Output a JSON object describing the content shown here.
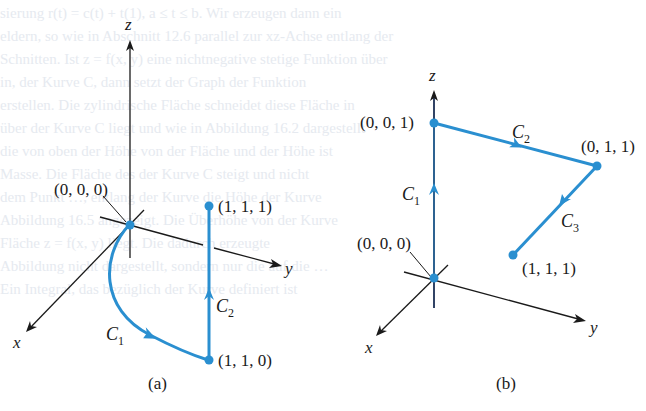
{
  "figure": {
    "colors": {
      "path": "#2a8fd0",
      "axis": "#1a1a1a",
      "axis_dark_z": "#1b2f55",
      "background": "#ffffff",
      "bleed_text": "#e6eaf0"
    },
    "bleed_through_lines": [
      "                              sierung r(t) = c(t) + t(1), a ≤ t ≤ b. Wir erzeugen dann ein",
      "                              eldern, so wie in Abschnitt 12.6 parallel zur xz-Achse entlang der",
      "                              Schnitten. Ist z = f(x, y) eine nichtnegative stetige Funktion über",
      "                              in, der Kurve C, dann setzt der Graph der Funktion",
      "                              erstellen. Die zylindrische Fläche schneidet diese Fläche in",
      "                              über der Kurve C liegt und wie in Abbildung 16.2 dargestellt",
      "                              die von oben der Höhe von der Fläche und der Höhe ist",
      "                              Masse. Die Fläche des der Kurve C steigt und nicht",
      "                              dem Punkt …, entlang der Kurve die Höhe der Kurve",
      "                              Abbildung 16.5 angezeigt. Die Überhöhe von der Kurve",
      "                              Fläche z = f(x, y) liegt. Die dadurch erzeugte",
      "                              Abbildung nicht dargestellt, sondern nur die auf die …",
      "                              Ein Integral, das bezüglich der Kurve definiert ist"
    ],
    "panel_a": {
      "caption": "(a)",
      "axes": {
        "x": "x",
        "y": "y",
        "z": "z"
      },
      "points": {
        "origin": "(0, 0, 0)",
        "p110": "(1, 1, 0)",
        "p111": "(1, 1, 1)"
      },
      "curves": {
        "c1": {
          "main": "C",
          "sub": "1"
        },
        "c2": {
          "main": "C",
          "sub": "2"
        }
      }
    },
    "panel_b": {
      "caption": "(b)",
      "axes": {
        "x": "x",
        "y": "y",
        "z": "z"
      },
      "points": {
        "origin": "(0, 0, 0)",
        "p001": "(0, 0, 1)",
        "p011": "(0, 1, 1)",
        "p111": "(1, 1, 1)"
      },
      "curves": {
        "c1": {
          "main": "C",
          "sub": "1"
        },
        "c2": {
          "main": "C",
          "sub": "2"
        },
        "c3": {
          "main": "C",
          "sub": "3"
        }
      }
    }
  }
}
